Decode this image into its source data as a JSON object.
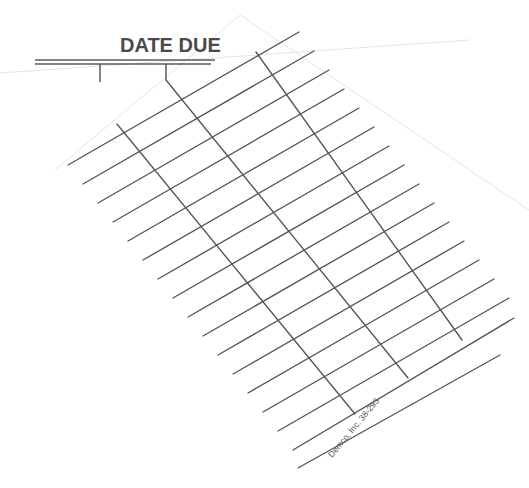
{
  "card": {
    "title": "DATE DUE",
    "imprint": "Demco, Inc. 38-293",
    "colors": {
      "paper": "#ffffff",
      "ink": "#555555",
      "title_ink": "#4a4a4a",
      "page_edge": "#e4e4e4"
    }
  },
  "header": {
    "double_rule": {
      "x1": 35,
      "x2": 215,
      "y_top": 60,
      "y_bottom": 64
    },
    "ticks": [
      {
        "x": 100,
        "y1": 64,
        "y2": 82
      },
      {
        "x": 166,
        "y1": 64,
        "y2": 80
      }
    ]
  },
  "grid": {
    "row_lines": [
      [
        68,
        165,
        299,
        32
      ],
      [
        83,
        184,
        314,
        51
      ],
      [
        98,
        203,
        329,
        70
      ],
      [
        113,
        222,
        344,
        89
      ],
      [
        128,
        241,
        359,
        108
      ],
      [
        143,
        260,
        374,
        127
      ],
      [
        158,
        279,
        389,
        146
      ],
      [
        173,
        298,
        404,
        165
      ],
      [
        188,
        317,
        419,
        184
      ],
      [
        203,
        336,
        434,
        203
      ],
      [
        218,
        355,
        449,
        222
      ],
      [
        233,
        374,
        464,
        241
      ],
      [
        248,
        393,
        479,
        260
      ],
      [
        263,
        412,
        494,
        279
      ],
      [
        278,
        431,
        509,
        298
      ],
      [
        293,
        450,
        514,
        318
      ],
      [
        298,
        468,
        500,
        355
      ]
    ],
    "column_lines": [
      [
        117,
        124,
        355,
        414
      ],
      [
        166,
        80,
        408,
        378
      ],
      [
        256,
        52,
        462,
        340
      ]
    ]
  },
  "page_edges": [
    [
      0,
      73,
      470,
      40
    ],
    [
      240,
      15,
      529,
      210
    ],
    [
      240,
      15,
      55,
      170
    ]
  ]
}
